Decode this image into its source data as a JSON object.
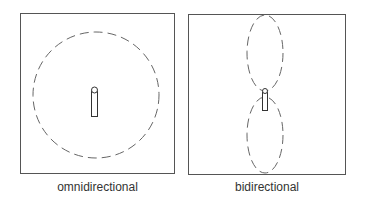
{
  "panels": [
    {
      "id": "omnidirectional",
      "caption": "omnidirectional",
      "pattern": "circle"
    },
    {
      "id": "bidirectional",
      "caption": "bidirectional",
      "pattern": "figure-eight"
    }
  ],
  "colors": {
    "frame": "#555555",
    "pattern": "#666666",
    "antenna": "#333333"
  }
}
